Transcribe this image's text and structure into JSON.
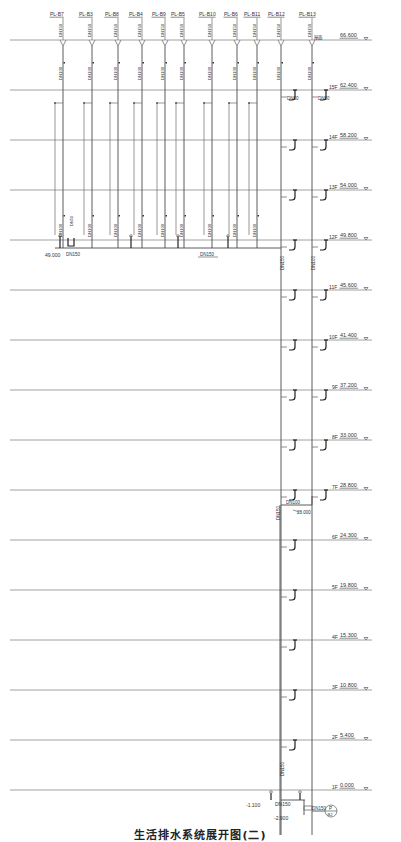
{
  "drawing": {
    "title": "生活排水系统展开图(二)",
    "roof": {
      "label": "屋面",
      "elevation": "66.600",
      "y": 40
    },
    "stacks": [
      {
        "id": "PL-B7",
        "x": 63
      },
      {
        "id": "PL-B3",
        "x": 92
      },
      {
        "id": "PL-B8",
        "x": 118
      },
      {
        "id": "PL-B4",
        "x": 142
      },
      {
        "id": "PL-B9",
        "x": 165
      },
      {
        "id": "PL-B5",
        "x": 184
      },
      {
        "id": "PL-B10",
        "x": 212
      },
      {
        "id": "PL-B6",
        "x": 237
      },
      {
        "id": "PL-B11",
        "x": 257
      },
      {
        "id": "PL-B12",
        "x": 281
      },
      {
        "id": "PL-B13",
        "x": 312
      }
    ],
    "stack_top_size": "DN150",
    "stack_size": "DN100",
    "floors": [
      {
        "label": "15F",
        "elevation": "62.400",
        "y": 90
      },
      {
        "label": "14F",
        "elevation": "58.200",
        "y": 140
      },
      {
        "label": "13F",
        "elevation": "54.000",
        "y": 190
      },
      {
        "label": "12F",
        "elevation": "49.800",
        "y": 240
      },
      {
        "label": "11F",
        "elevation": "45.600",
        "y": 290
      },
      {
        "label": "10F",
        "elevation": "41.400",
        "y": 340
      },
      {
        "label": "9F",
        "elevation": "37.200",
        "y": 390
      },
      {
        "label": "8F",
        "elevation": "33.000",
        "y": 440
      },
      {
        "label": "7F",
        "elevation": "28.800",
        "y": 490
      },
      {
        "label": "6F",
        "elevation": "24.300",
        "y": 540
      },
      {
        "label": "5F",
        "elevation": "19.800",
        "y": 590
      },
      {
        "label": "4F",
        "elevation": "15.300",
        "y": 640
      },
      {
        "label": "3F",
        "elevation": "10.800",
        "y": 690
      },
      {
        "label": "2F",
        "elevation": "5.400",
        "y": 740
      },
      {
        "label": "1F",
        "elevation": "0.000",
        "y": 790
      }
    ],
    "annotations": {
      "branch_dn50": "DN50",
      "header_dn150": "DN150",
      "header_elev": "49.000",
      "riser_dn150": "DN150",
      "riser_dn100": "DN100",
      "offset_dn100": "DN100",
      "offset_elev": "28.000",
      "lower_riser_dn150": "DN150",
      "bottom_riser_dn150": "DN150",
      "base_elev_1": "-1.100",
      "base_dn150": "DN150",
      "base_elev_2": "-2.900",
      "outlet_dn150": "DN150",
      "outlet_symbol_top": "P",
      "outlet_symbol_bottom": "B2"
    }
  }
}
